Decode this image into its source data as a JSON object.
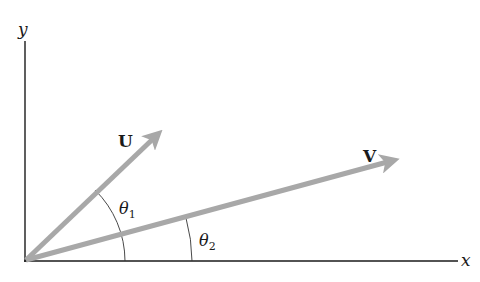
{
  "diagram": {
    "axes": {
      "x_label": "x",
      "y_label": "y",
      "origin": [
        25,
        261
      ],
      "x_end": [
        458,
        261
      ],
      "y_end": [
        25,
        41
      ],
      "axis_color": "#1a1a1a"
    },
    "vectors": [
      {
        "name": "U",
        "label": "U",
        "tail": [
          25,
          261
        ],
        "tip": [
          162,
          130
        ],
        "color": "#a8a8a8"
      },
      {
        "name": "V",
        "label": "V",
        "tail": [
          25,
          261
        ],
        "tip": [
          398,
          159
        ],
        "color": "#a8a8a8"
      }
    ],
    "angles": [
      {
        "name": "theta1",
        "symbol": "θ",
        "subscript": "1",
        "between": [
          "x-axis",
          "U"
        ],
        "arc_radius": 100
      },
      {
        "name": "theta2",
        "symbol": "θ",
        "subscript": "2",
        "between": [
          "x-axis",
          "V"
        ],
        "arc_radius": 167
      }
    ]
  }
}
